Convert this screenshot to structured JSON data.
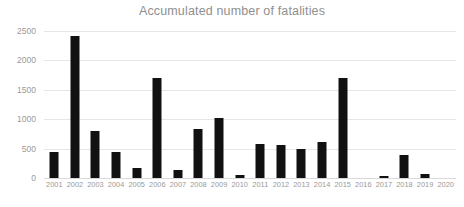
{
  "chart_data": {
    "type": "bar",
    "title": "Accumulated number of fatalities",
    "xlabel": "",
    "ylabel": "",
    "categories": [
      "2001",
      "2002",
      "2003",
      "2004",
      "2005",
      "2006",
      "2007",
      "2008",
      "2009",
      "2010",
      "2011",
      "2012",
      "2013",
      "2014",
      "2015",
      "2016",
      "2017",
      "2018",
      "2019",
      "2020"
    ],
    "values": [
      440,
      2415,
      800,
      440,
      170,
      1700,
      130,
      830,
      1020,
      50,
      580,
      560,
      490,
      620,
      1700,
      0,
      40,
      390,
      70,
      0
    ],
    "ylim": [
      0,
      2500
    ],
    "yticks": [
      0,
      500,
      1000,
      1500,
      2000,
      2500
    ],
    "ytick_labels": [
      "0",
      "500",
      "1000",
      "1500",
      "2000",
      "2500"
    ],
    "grid": true,
    "legend": false,
    "bar_color": "#111111",
    "gridline_color": "#e6e6e6",
    "text_color": "#9a9a9a",
    "title_color": "#8f8f8f",
    "background_color": "#ffffff"
  }
}
